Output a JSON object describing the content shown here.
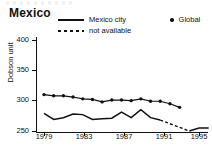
{
  "title": "Mexico",
  "legend": {
    "items": [
      {
        "label": "Mexico city",
        "style": "solid"
      },
      {
        "label": "not available",
        "style": "dashed"
      },
      {
        "label": "Global",
        "style": "dot"
      }
    ]
  },
  "axes": {
    "ylabel": "Dobson unit",
    "yticks": [
      "250",
      "300",
      "350",
      "400"
    ],
    "xticks": [
      "1979",
      "1983",
      "1987",
      "1991",
      "1995"
    ]
  },
  "colors": {
    "line": "#111111",
    "background": "#ffffff"
  },
  "chart_data": {
    "type": "line",
    "title": "Mexico",
    "xlabel": "",
    "ylabel": "Dobson unit",
    "xlim": [
      1979,
      1996
    ],
    "ylim": [
      250,
      400
    ],
    "yticks": [
      250,
      300,
      350,
      400
    ],
    "xticks": [
      1979,
      1983,
      1987,
      1991,
      1995
    ],
    "grid": false,
    "legend_position": "top",
    "series": [
      {
        "name": "Global",
        "style": "line-with-markers",
        "marker": "filled-circle",
        "x": [
          1979,
          1980,
          1981,
          1982,
          1983,
          1984,
          1985,
          1986,
          1987,
          1988,
          1989,
          1990,
          1991,
          1992,
          1993
        ],
        "values": [
          310,
          308,
          308,
          306,
          303,
          302,
          298,
          301,
          301,
          300,
          303,
          299,
          299,
          295,
          289
        ]
      },
      {
        "name": "Mexico city",
        "style": "solid",
        "x": [
          1979,
          1980,
          1981,
          1982,
          1983,
          1984,
          1985,
          1986,
          1987,
          1988,
          1989,
          1990,
          1991
        ],
        "values": [
          279,
          269,
          272,
          278,
          277,
          269,
          270,
          271,
          281,
          272,
          285,
          272,
          268
        ]
      },
      {
        "name": "not available",
        "style": "dashed",
        "x": [
          1991,
          1992,
          1993,
          1994
        ],
        "values": [
          268,
          262,
          256,
          250
        ]
      },
      {
        "name": "Mexico city (resumed)",
        "style": "solid",
        "x": [
          1994,
          1995,
          1996
        ],
        "values": [
          250,
          255,
          255
        ]
      }
    ]
  }
}
